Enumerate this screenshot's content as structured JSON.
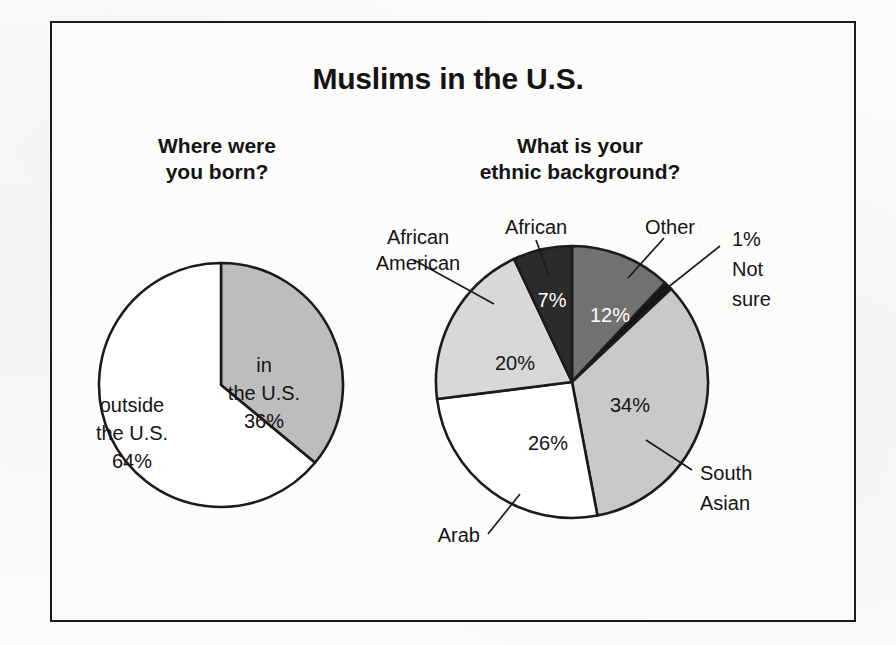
{
  "figure": {
    "title": "Muslims in the U.S.",
    "frame_color": "#1b1b1b",
    "background": "#fcfcfb"
  },
  "panels": {
    "left": {
      "title_line1": "Where were",
      "title_line2": "you born?"
    },
    "right": {
      "title_line1": "What is your",
      "title_line2": "ethnic background?"
    }
  },
  "labels": {
    "left": {
      "in_us_l1": "in",
      "in_us_l2": "the U.S.",
      "in_us_l3": "36%",
      "outside_l1": "outside",
      "outside_l2": "the U.S.",
      "outside_l3": "64%"
    },
    "right": {
      "african_american_l1": "African",
      "african_american_l2": "American",
      "african": "African",
      "other": "Other",
      "not_sure_l1": "1%",
      "not_sure_l2": "Not",
      "not_sure_l3": "sure",
      "south_asian_l1": "South",
      "south_asian_l2": "Asian",
      "arab": "Arab",
      "pct_african": "7%",
      "pct_other": "12%",
      "pct_african_american": "20%",
      "pct_arab": "26%",
      "pct_south_asian": "34%"
    }
  },
  "chart_data": [
    {
      "type": "pie",
      "title": "Where were you born?",
      "categories": [
        "in the U.S.",
        "outside the U.S."
      ],
      "values": [
        36,
        64
      ],
      "value_labels": [
        "36%",
        "64%"
      ],
      "colors": [
        "#bdbdbd",
        "#ffffff"
      ],
      "units": "percent",
      "start_angle_deg": 0,
      "direction": "clockwise",
      "legend": "none",
      "grid": false
    },
    {
      "type": "pie",
      "title": "What is your ethnic background?",
      "categories": [
        "Other",
        "Not sure",
        "South Asian",
        "Arab",
        "African American",
        "African"
      ],
      "values": [
        12,
        1,
        34,
        26,
        20,
        7
      ],
      "value_labels": [
        "12%",
        "1%",
        "34%",
        "26%",
        "20%",
        "7%"
      ],
      "colors": [
        "#717171",
        "#141414",
        "#c9c9c9",
        "#ffffff",
        "#d8d8d8",
        "#2b2b2b"
      ],
      "units": "percent",
      "start_angle_deg": 0,
      "direction": "clockwise",
      "legend": "none",
      "grid": false
    }
  ]
}
